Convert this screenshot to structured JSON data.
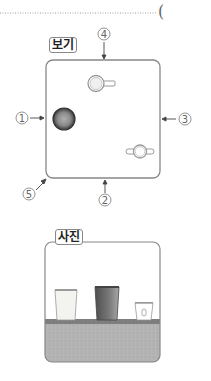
{
  "header": {
    "answer_paren": "("
  },
  "view_box": {
    "label": "보기",
    "positions": [
      {
        "id": "1",
        "symbol": "①",
        "side": "left"
      },
      {
        "id": "2",
        "symbol": "②",
        "side": "bottom"
      },
      {
        "id": "3",
        "symbol": "③",
        "side": "right"
      },
      {
        "id": "4",
        "symbol": "④",
        "side": "top"
      },
      {
        "id": "5",
        "symbol": "⑤",
        "side": "bottom-left-corner"
      }
    ],
    "objects": [
      {
        "name": "dark-cup-top-view",
        "shape": "circle"
      },
      {
        "name": "mug-top-view",
        "shape": "cup-with-handle"
      },
      {
        "name": "two-handled-cup-top-view",
        "shape": "cup-with-two-handles"
      }
    ]
  },
  "photo_box": {
    "label": "사진",
    "objects": [
      {
        "name": "light-tall-cup"
      },
      {
        "name": "dark-tall-cup"
      },
      {
        "name": "small-cup-with-handle"
      }
    ],
    "colors": {
      "shelf": "#8a8a8a",
      "ground": "#b4b4b4",
      "dark_cup": "#6e6e6e",
      "light_cup": "#f0f0ec"
    }
  }
}
